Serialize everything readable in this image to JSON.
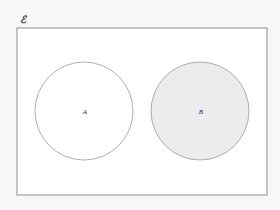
{
  "figure": {
    "type": "venn-diagram",
    "background_color": "#f7f7f7",
    "canvas": {
      "width": 280,
      "height": 210
    }
  },
  "universe": {
    "label": "ℰ",
    "label_x": 23,
    "label_y": 20,
    "label_font_size": 10,
    "rect": {
      "x": 17,
      "y": 28,
      "width": 250,
      "height": 167
    },
    "fill": "#ffffff",
    "stroke": "#8d8d8d",
    "stroke_width": 1
  },
  "sets": [
    {
      "name": "set-a",
      "label": "A",
      "cx": 84,
      "cy": 111,
      "r": 49,
      "fill": "#ffffff",
      "stroke": "#9a9a9a",
      "stroke_width": 0.8,
      "shaded": false,
      "label_font_size": 7
    },
    {
      "name": "set-b",
      "label": "B",
      "cx": 200,
      "cy": 111,
      "r": 49,
      "fill": "#ececec",
      "stroke": "#9a9a9a",
      "stroke_width": 0.8,
      "shaded": true,
      "label_font_size": 7
    }
  ],
  "relationship": {
    "overlap": false,
    "description": "A and B are disjoint; region B is shaded"
  }
}
